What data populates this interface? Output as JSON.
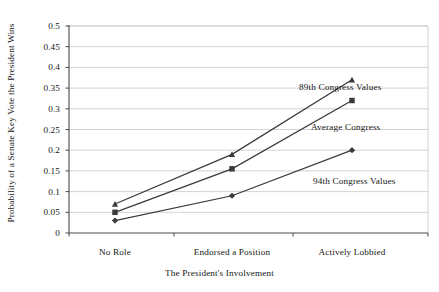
{
  "chart_data": {
    "type": "line",
    "title": "",
    "xlabel": "The President's Involvement",
    "ylabel": "Probability of a Senate Key Vote the President Wins",
    "categories": [
      "No Role",
      "Endorsed a Position",
      "Actively Lobbied"
    ],
    "yticks": [
      "0",
      "0.05",
      "0.1",
      "0.15",
      "0.2",
      "0.25",
      "0.3",
      "0.35",
      "0.4",
      "0.45",
      "0.5"
    ],
    "ytick_values": [
      0,
      0.05,
      0.1,
      0.15,
      0.2,
      0.25,
      0.3,
      0.35,
      0.4,
      0.45,
      0.5
    ],
    "ylim": [
      0,
      0.5
    ],
    "grid": "horizontal",
    "legend_position": "inline-annotations",
    "series": [
      {
        "name": "89th Congress Values",
        "marker": "triangle",
        "values": [
          0.07,
          0.19,
          0.37
        ],
        "color": "#3a3a3a"
      },
      {
        "name": "Average Congress",
        "marker": "square",
        "values": [
          0.05,
          0.155,
          0.32
        ],
        "color": "#3a3a3a"
      },
      {
        "name": "94th Congress Values",
        "marker": "diamond",
        "values": [
          0.03,
          0.09,
          0.2
        ],
        "color": "#3a3a3a"
      }
    ],
    "annotations": [
      {
        "text": "89th Congress Values",
        "x": 299,
        "y": 82
      },
      {
        "text": "Average Congress",
        "x": 311,
        "y": 122
      },
      {
        "text": "94th Congress Values",
        "x": 313,
        "y": 176
      }
    ]
  },
  "style": {
    "grid_color": "#c8c8c8",
    "axis_color": "#4a4a4a",
    "line_color": "#3a3a3a",
    "background": "#ffffff"
  }
}
